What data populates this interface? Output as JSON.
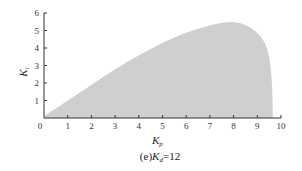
{
  "chart_data": {
    "type": "area",
    "title": "",
    "caption": "(e)K_d=12",
    "caption_parts": {
      "prefix": "(e)",
      "var": "K",
      "sub": "d",
      "suffix": "=12"
    },
    "xlabel": "K_p",
    "xlabel_parts": {
      "var": "K",
      "sub": "p"
    },
    "ylabel": "K_i",
    "ylabel_parts": {
      "var": "K",
      "sub": "i"
    },
    "xlim": [
      0,
      10
    ],
    "ylim": [
      0,
      6
    ],
    "xticks": [
      0,
      1,
      2,
      3,
      4,
      5,
      6,
      7,
      8,
      9,
      10
    ],
    "yticks": [
      1,
      2,
      3,
      4,
      5,
      6
    ],
    "origin_label": "0",
    "grid": false,
    "legend": null,
    "fill_color": "#cfcfcf",
    "series": [
      {
        "name": "stable region boundary (upper)",
        "x": [
          0,
          0.5,
          1,
          2,
          3,
          4,
          5,
          6,
          7,
          7.5,
          8,
          8.5,
          9,
          9.3,
          9.5,
          9.6,
          9.65,
          9.65
        ],
        "y": [
          0.1,
          0.55,
          1.0,
          1.9,
          2.8,
          3.6,
          4.3,
          4.9,
          5.3,
          5.45,
          5.5,
          5.35,
          4.9,
          4.4,
          3.6,
          2.5,
          1.0,
          0
        ]
      }
    ]
  }
}
